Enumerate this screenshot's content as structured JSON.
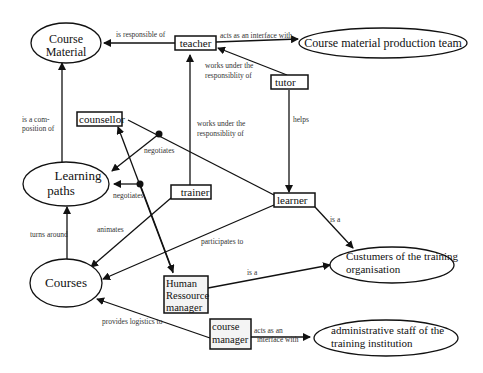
{
  "diagram": {
    "type": "concept-map",
    "nodes": {
      "course_material": {
        "label_lines": [
          "Course",
          "Material"
        ],
        "shape": "ellipse"
      },
      "teacher": {
        "label": "teacher",
        "shape": "box"
      },
      "production_team": {
        "label": "Course material production team",
        "shape": "ellipse"
      },
      "tutor": {
        "label": "tutor",
        "shape": "box"
      },
      "counsellor": {
        "label": "counsellor",
        "shape": "box"
      },
      "learning_paths": {
        "label_lines": [
          "Learning",
          "paths"
        ],
        "shape": "ellipse"
      },
      "trainer": {
        "label": "trainer",
        "shape": "box"
      },
      "learner": {
        "label": "learner",
        "shape": "box"
      },
      "courses": {
        "label": "Courses",
        "shape": "ellipse"
      },
      "hr_manager": {
        "label_lines": [
          "Human",
          "Ressource",
          "manager"
        ],
        "shape": "box"
      },
      "customers": {
        "label_lines": [
          "Custumers of the training",
          "organisation"
        ],
        "shape": "ellipse"
      },
      "course_manager": {
        "label_lines": [
          "course",
          "manager"
        ],
        "shape": "box"
      },
      "admin_staff": {
        "label_lines": [
          "administrative staff of the",
          "training institution"
        ],
        "shape": "ellipse"
      }
    },
    "edges": {
      "teacher_material": {
        "from": "teacher",
        "to": "course_material",
        "label": "is responsible of"
      },
      "teacher_team": {
        "from": "teacher",
        "to": "production_team",
        "label": "acts as an interface with"
      },
      "tutor_teacher": {
        "from": "tutor",
        "to": "teacher",
        "label_lines": [
          "works under the",
          "responsiblity of"
        ]
      },
      "trainer_teacher": {
        "from": "trainer",
        "to": "teacher",
        "label_lines": [
          "works under the",
          "responsiblity of"
        ]
      },
      "tutor_learner": {
        "from": "tutor",
        "to": "learner",
        "label": "helps"
      },
      "paths_material": {
        "from": "learning_paths",
        "to": "course_material",
        "label_lines": [
          "is a com-",
          "position of"
        ]
      },
      "counsellor_learner_negotiates": {
        "from": "counsellor",
        "to": "learning_paths",
        "label": "negotiates"
      },
      "hr_negotiates": {
        "from": "hr_manager",
        "to": "learning_paths",
        "label": "negotiates"
      },
      "courses_paths": {
        "from": "courses",
        "to": "learning_paths",
        "label": "turns around"
      },
      "trainer_courses": {
        "from": "trainer",
        "to": "courses",
        "label": "animates"
      },
      "learner_courses": {
        "from": "learner",
        "to": "courses",
        "label": "participates to"
      },
      "learner_customers": {
        "from": "learner",
        "to": "customers",
        "label": "is a"
      },
      "hr_customers": {
        "from": "hr_manager",
        "to": "customers",
        "label": "is a"
      },
      "manager_courses": {
        "from": "course_manager",
        "to": "courses",
        "label": "provides logistics to"
      },
      "manager_admin": {
        "from": "course_manager",
        "to": "admin_staff",
        "label_lines": [
          "acts as an",
          "interface with"
        ]
      }
    }
  }
}
